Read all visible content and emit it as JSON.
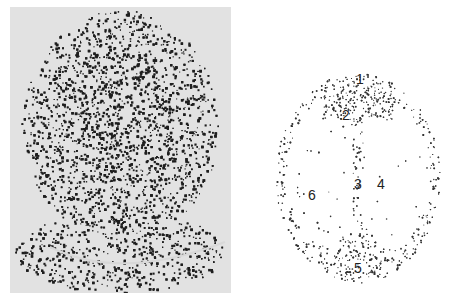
{
  "figure": {
    "left_panel": {
      "description": "Photographic scan (stippled scintigram) of head, frontal view",
      "background_color": "#e2e2e2",
      "dot_color": "#1e1e1e"
    },
    "right_panel": {
      "description": "Schematic stipple diagram of head cross-section with labeled regions",
      "labels": [
        {
          "id": "1",
          "text": "1",
          "x": 86,
          "y": 12
        },
        {
          "id": "2",
          "text": "2",
          "x": 72,
          "y": 48
        },
        {
          "id": "3",
          "text": "3",
          "x": 84,
          "y": 117
        },
        {
          "id": "4",
          "text": "4",
          "x": 107,
          "y": 117
        },
        {
          "id": "5",
          "text": "5",
          "x": 84,
          "y": 201
        },
        {
          "id": "6",
          "text": "6",
          "x": 38,
          "y": 128
        }
      ]
    }
  }
}
